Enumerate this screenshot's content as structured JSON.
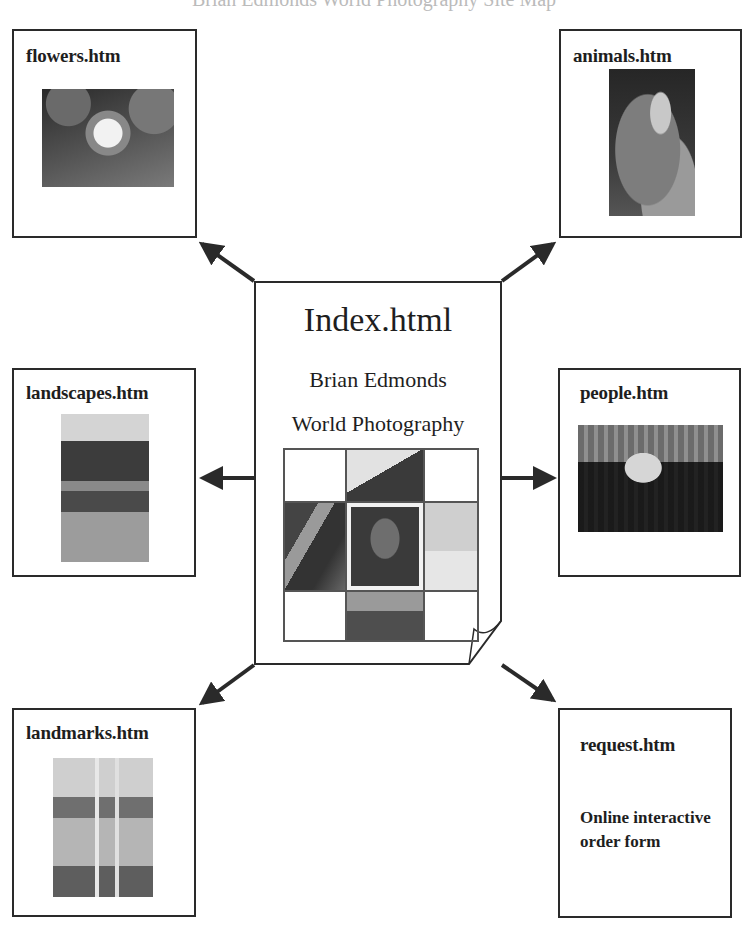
{
  "diagram": {
    "cutoff_heading": "Brian Edmonds World Photography Site Map",
    "center": {
      "title": "Index.html",
      "line1": "Brian Edmonds",
      "line2": "World Photography"
    },
    "pages": [
      {
        "id": "flowers",
        "title": "flowers.htm",
        "image": "water lily photo"
      },
      {
        "id": "animals",
        "title": "animals.htm",
        "image": "parrot photo"
      },
      {
        "id": "landscapes",
        "title": "landscapes.htm",
        "image": "river landscape photo"
      },
      {
        "id": "people",
        "title": "people.htm",
        "image": "crowd surfer photo"
      },
      {
        "id": "landmarks",
        "title": "landmarks.htm",
        "image": "ruins with columns and pool photo"
      },
      {
        "id": "request",
        "title": "request.htm",
        "description": "Online interactive order form"
      }
    ],
    "colors": {
      "line": "#2a2a2a",
      "background": "#ffffff"
    }
  }
}
